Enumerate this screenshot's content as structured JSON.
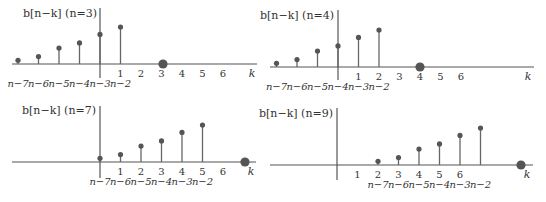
{
  "colors": {
    "axis": "#555555",
    "stem": "#666666",
    "dot": "#555555",
    "text": "#333333"
  },
  "chart_data": [
    {
      "type": "stem",
      "title": "b[n−k] (n=3)",
      "n": 3,
      "xlabel": "k",
      "k_ticks": [
        "1",
        "2",
        "3",
        "4",
        "5",
        "6"
      ],
      "n_labels": [
        "n−7",
        "n−6",
        "n−5",
        "n−4",
        "n−3",
        "n−2"
      ],
      "stem_values": [
        0.1,
        0.2,
        0.43,
        0.57,
        0.8,
        1.0
      ],
      "marker_k": 3
    },
    {
      "type": "stem",
      "title": "b[n−k] (n=4)",
      "n": 4,
      "xlabel": "k",
      "k_ticks": [
        "1",
        "2",
        "3",
        "4",
        "5",
        "6"
      ],
      "n_labels": [
        "n−7",
        "n−6",
        "n−5",
        "n−4",
        "n−3",
        "n−2"
      ],
      "stem_values": [
        0.1,
        0.2,
        0.43,
        0.57,
        0.8,
        1.0
      ],
      "marker_k": 4
    },
    {
      "type": "stem",
      "title": "b[n−k] (n=7)",
      "n": 7,
      "xlabel": "k",
      "k_ticks": [
        "1",
        "2",
        "3",
        "4",
        "5",
        "6"
      ],
      "n_labels": [
        "n−7",
        "n−6",
        "n−5",
        "n−4",
        "n−3",
        "n−2"
      ],
      "stem_values": [
        0.1,
        0.2,
        0.43,
        0.57,
        0.8,
        1.0
      ],
      "marker_k": 7
    },
    {
      "type": "stem",
      "title": "b[n−k] (n=9)",
      "n": 9,
      "xlabel": "k",
      "k_ticks": [
        "1",
        "2",
        "3",
        "4",
        "5",
        "6"
      ],
      "n_labels": [
        "n−7",
        "n−6",
        "n−5",
        "n−4",
        "n−3",
        "n−2"
      ],
      "stem_values": [
        0.1,
        0.2,
        0.43,
        0.57,
        0.8,
        1.0
      ],
      "marker_k": 9
    }
  ],
  "layout": {
    "panels": [
      {
        "x0": 12,
        "x1": 257,
        "axis_x": 100,
        "base_y": 64,
        "vtop": 8,
        "vbot": 78,
        "title_x": 97,
        "title_y": 17,
        "dx": 20.5,
        "marker_x": 163,
        "k_label_x": 252
      },
      {
        "x0": 270,
        "x1": 534,
        "axis_x": 338,
        "base_y": 67,
        "vtop": 10,
        "vbot": 80,
        "title_x": 334,
        "title_y": 19,
        "dx": 20.5,
        "marker_x": 420,
        "k_label_x": 528
      },
      {
        "x0": 12,
        "x1": 256,
        "axis_x": 100,
        "base_y": 162,
        "vtop": 106,
        "vbot": 178,
        "title_x": 96,
        "title_y": 114,
        "dx": 20.5,
        "marker_x": 245,
        "k_label_x": 251
      },
      {
        "x0": 270,
        "x1": 533,
        "axis_x": 337,
        "base_y": 165,
        "vtop": 108,
        "vbot": 180,
        "title_x": 333,
        "title_y": 117,
        "dx": 20.5,
        "marker_x": 521,
        "k_label_x": 527
      }
    ],
    "max_stem_px": 37
  }
}
